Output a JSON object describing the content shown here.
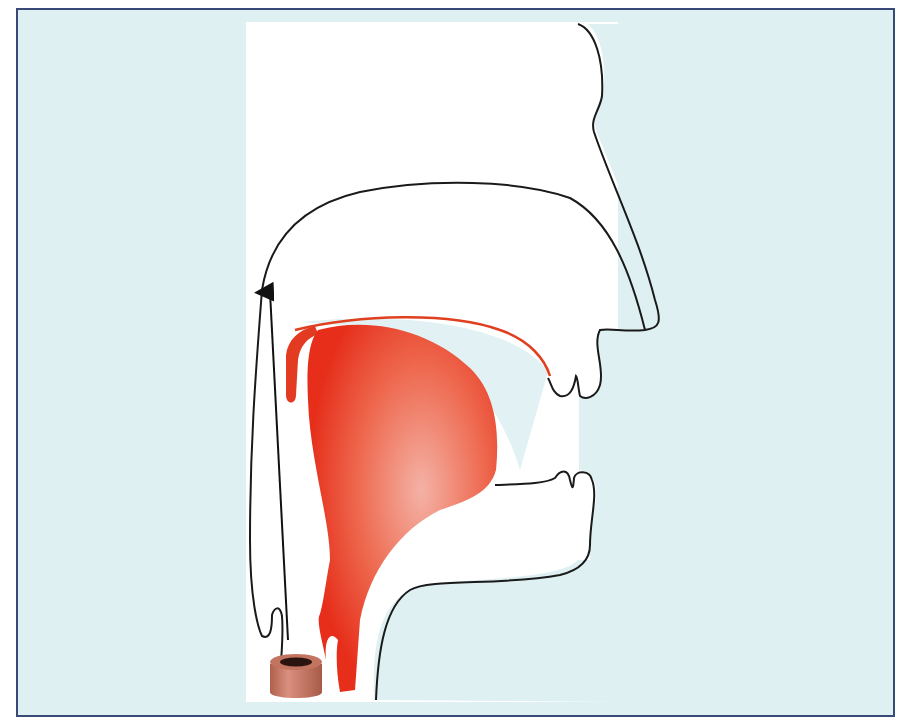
{
  "diagram": {
    "title": "",
    "colors": {
      "background": "#dff0f3",
      "frame_border": "#3a4a78",
      "head_fill": "#ffffff",
      "outline": "#1a1a1a",
      "muscle_dark": "#e62e1a",
      "muscle_light": "#f4b2a6",
      "cylinder": "#c9806e",
      "arrow": "#111111"
    },
    "elements": [
      {
        "id": "head-outline",
        "label": ""
      },
      {
        "id": "tongue-muscle",
        "label": ""
      },
      {
        "id": "palate-muscle-strip",
        "label": ""
      },
      {
        "id": "airflow-arrow",
        "label": ""
      },
      {
        "id": "device-cylinder",
        "label": ""
      }
    ]
  }
}
